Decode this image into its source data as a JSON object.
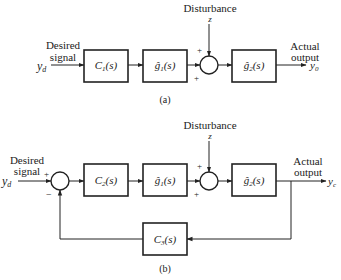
{
  "diagram_a": {
    "caption": "(a)",
    "input_symbol": "y",
    "input_sub": "d",
    "input_label_line1": "Desired",
    "input_label_line2": "signal",
    "blocks": [
      {
        "name": "C",
        "sub": "1",
        "arg": "(s)"
      },
      {
        "name": "ĝ",
        "sub": "1",
        "arg": "(s)"
      },
      {
        "name": "ĝ",
        "sub": "2",
        "arg": "(s)"
      }
    ],
    "disturbance_label": "Disturbance",
    "disturbance_symbol": "z",
    "sum_signs": {
      "top": "+",
      "left": "+"
    },
    "output_label_line1": "Actual",
    "output_label_line2": "output",
    "output_symbol": "y",
    "output_sub": "0"
  },
  "diagram_b": {
    "caption": "(b)",
    "input_symbol": "y",
    "input_sub": "d",
    "input_label_line1": "Desired",
    "input_label_line2": "signal",
    "blocks": [
      {
        "name": "C",
        "sub": "2",
        "arg": "(s)"
      },
      {
        "name": "ĝ",
        "sub": "1",
        "arg": "(s)"
      },
      {
        "name": "ĝ",
        "sub": "2",
        "arg": "(s)"
      },
      {
        "name": "C",
        "sub": "3",
        "arg": "(s)"
      }
    ],
    "disturbance_label": "Disturbance",
    "disturbance_symbol": "z",
    "sum1_signs": {
      "left": "+",
      "bottom": "−"
    },
    "sum2_signs": {
      "top": "+",
      "left": "+"
    },
    "output_label_line1": "Actual",
    "output_label_line2": "output",
    "output_symbol": "y",
    "output_sub": "c"
  }
}
